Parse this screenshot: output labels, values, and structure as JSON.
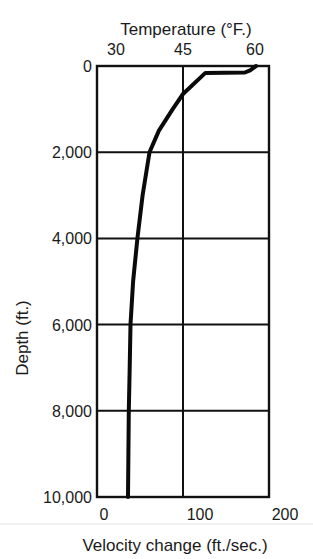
{
  "chart_data": {
    "type": "line",
    "title": "",
    "top_axis": {
      "label": "Temperature (°F.)",
      "ticks": [
        30,
        45,
        60
      ],
      "tick_labels": [
        "30",
        "45",
        "60"
      ]
    },
    "xlabel": "Velocity change (ft./sec.)",
    "xlim": [
      0,
      200
    ],
    "xticks": [
      0,
      100,
      200
    ],
    "xtick_labels": [
      "0",
      "100",
      "200"
    ],
    "ylabel": "Depth (ft.)",
    "ylim": [
      0,
      10000
    ],
    "y_inverted": true,
    "yticks": [
      0,
      2000,
      4000,
      6000,
      8000,
      10000
    ],
    "ytick_labels": [
      "0",
      "2,000",
      "4,000",
      "6,000",
      "8,000",
      "10,000"
    ],
    "grid": true,
    "series": [
      {
        "name": "Velocity change vs depth",
        "x": [
          185,
          178,
          172,
          126,
          100,
          88,
          72,
          61,
          53,
          47,
          42,
          39,
          38,
          37,
          36.5,
          36
        ],
        "y": [
          0,
          100,
          150,
          160,
          650,
          1000,
          1500,
          2000,
          3000,
          4000,
          5000,
          6000,
          7000,
          8000,
          9000,
          10000
        ]
      }
    ]
  }
}
